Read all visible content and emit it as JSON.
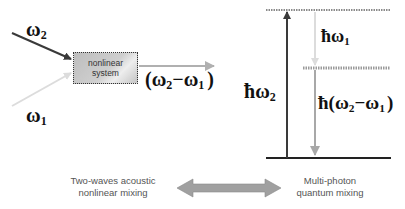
{
  "left_panel": {
    "input_high": {
      "symbol": "ω",
      "sub": "2"
    },
    "input_low": {
      "symbol": "ω",
      "sub": "1"
    },
    "system_box": {
      "line1": "nonlinear",
      "line2": "system"
    },
    "output": {
      "open": "(",
      "a": "ω",
      "a_sub": "2",
      "minus": "−",
      "b": "ω",
      "b_sub": "1",
      "close": ")"
    }
  },
  "right_panel": {
    "pump_label": {
      "hbar": "ħ",
      "symbol": "ω",
      "sub": "2"
    },
    "signal_label": {
      "hbar": "ħ",
      "symbol": "ω",
      "sub": "1"
    },
    "difference_label": {
      "hbar": "ħ",
      "open": "(",
      "a": "ω",
      "a_sub": "2",
      "minus": "−",
      "b": "ω",
      "b_sub": "1",
      "close": ")"
    },
    "levels": [
      "upper virtual level",
      "intermediate virtual level",
      "ground level"
    ]
  },
  "captions": {
    "left": {
      "line1": "Two-waves acoustic",
      "line2": "nonlinear mixing"
    },
    "right": {
      "line1": "Multi-photon",
      "line2": "quantum mixing"
    }
  },
  "colors": {
    "dark_arrow": "#3a3a3a",
    "light_arrow": "#dcdcdc",
    "mid_arrow": "#a8a8a8",
    "double_arrow": "#9a9a9a",
    "level_line": "#8a8a8a",
    "ground_line": "#222222"
  }
}
